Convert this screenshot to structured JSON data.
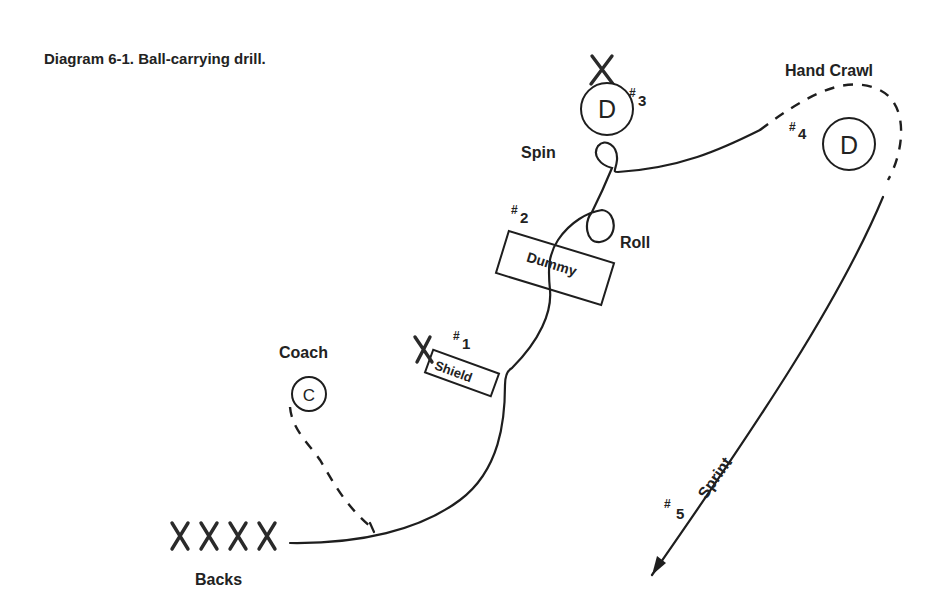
{
  "caption": "Diagram 6-1.  Ball-carrying drill.",
  "labels": {
    "hand_crawl": "Hand Crawl",
    "spin": "Spin",
    "roll": "Roll",
    "coach": "Coach",
    "backs": "Backs",
    "sprint": "Sprint"
  },
  "stations": [
    {
      "number": "1",
      "hash": "#",
      "object": "Shield"
    },
    {
      "number": "2",
      "hash": "#",
      "object": "Dummy"
    },
    {
      "number": "3",
      "hash": "#",
      "object": "D"
    },
    {
      "number": "4",
      "hash": "#",
      "object": "D"
    },
    {
      "number": "5",
      "hash": "#",
      "object": ""
    }
  ],
  "players": {
    "coach_symbol": "C",
    "defender_symbol": "D",
    "backs_count": 4,
    "backs_symbol": "X"
  },
  "colors": {
    "ink": "#1e1e1e",
    "background": "#ffffff"
  }
}
